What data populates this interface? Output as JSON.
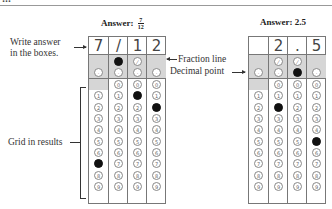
{
  "header": {
    "cut_text": "…",
    "rule": true
  },
  "left_example": {
    "title_prefix": "Answer:",
    "fraction": {
      "numerator": "7",
      "denominator": "12"
    },
    "boxes": [
      "7",
      "/",
      "1",
      "2"
    ],
    "filled": {
      "slash_row": [
        false,
        true,
        false,
        false
      ],
      "decimal_row": [
        false,
        false,
        false,
        false
      ],
      "digits": [
        7,
        null,
        1,
        2
      ]
    }
  },
  "right_example": {
    "title": "Answer: 2.5",
    "boxes": [
      "",
      "2",
      ".",
      "5"
    ],
    "filled": {
      "slash_row": [
        false,
        false,
        false,
        false
      ],
      "decimal_row": [
        false,
        false,
        true,
        false
      ],
      "digits": [
        null,
        2,
        null,
        5
      ]
    }
  },
  "annotations": {
    "write_answer": "Write answer",
    "write_answer_2": "in the boxes.",
    "fraction_line": "Fraction line",
    "decimal_point": "Decimal point",
    "grid_in_results": "Grid in results"
  },
  "grid": {
    "slash_symbol": "⁄",
    "decimal_symbol": "·",
    "digits": [
      "0",
      "1",
      "2",
      "3",
      "4",
      "5",
      "6",
      "7",
      "8",
      "9"
    ],
    "shade_color": "#d6d6d6",
    "fill_color": "#111111"
  }
}
